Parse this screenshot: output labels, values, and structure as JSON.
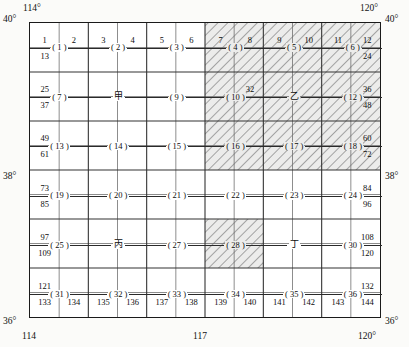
{
  "figure": {
    "type": "map-grid-index",
    "columns": 12,
    "rows": 12
  },
  "axes": {
    "top_left_longitude": "114°",
    "top_right_longitude": "120°",
    "bottom_left_longitude": "114",
    "bottom_mid_longitude": "117",
    "bottom_right_longitude": "120°",
    "top_left_latitude": "40°",
    "top_right_latitude": "40°",
    "mid_left_latitude": "38°",
    "mid_right_latitude": "38°",
    "bottom_left_latitude": "36°",
    "bottom_right_latitude": "36°"
  },
  "chart_data": {
    "type": "table",
    "title": "",
    "xlabel": "Longitude",
    "ylabel": "Latitude",
    "xlim": [
      114,
      120
    ],
    "ylim": [
      36,
      40
    ],
    "grid": true,
    "legend": "none",
    "cell_numbers": [
      [
        1,
        2,
        3,
        4,
        5,
        6,
        7,
        8,
        9,
        10,
        11,
        12
      ],
      [
        13,
        14,
        15,
        16,
        17,
        18,
        19,
        20,
        21,
        22,
        23,
        24
      ],
      [
        25,
        26,
        27,
        28,
        29,
        30,
        31,
        32,
        33,
        34,
        35,
        36
      ],
      [
        37,
        38,
        39,
        40,
        41,
        42,
        43,
        44,
        45,
        46,
        47,
        48
      ],
      [
        49,
        50,
        51,
        52,
        53,
        54,
        55,
        56,
        57,
        58,
        59,
        60
      ],
      [
        61,
        62,
        63,
        64,
        65,
        66,
        67,
        68,
        69,
        70,
        71,
        72
      ],
      [
        73,
        74,
        75,
        76,
        77,
        78,
        79,
        80,
        81,
        82,
        83,
        84
      ],
      [
        85,
        86,
        87,
        88,
        89,
        90,
        91,
        92,
        93,
        94,
        95,
        96
      ],
      [
        97,
        98,
        99,
        100,
        101,
        102,
        103,
        104,
        105,
        106,
        107,
        108
      ],
      [
        109,
        110,
        111,
        112,
        113,
        114,
        115,
        116,
        117,
        118,
        119,
        120
      ],
      [
        121,
        122,
        123,
        124,
        125,
        126,
        127,
        128,
        129,
        130,
        131,
        132
      ],
      [
        133,
        134,
        135,
        136,
        137,
        138,
        139,
        140,
        141,
        142,
        143,
        144
      ]
    ],
    "visible_cell_labels": {
      "row1": [
        "1",
        "2",
        "3",
        "4",
        "5",
        "6",
        "7",
        "8",
        "9",
        "10",
        "11",
        "12"
      ],
      "row12": [
        "133",
        "134",
        "135",
        "136",
        "137",
        "138",
        "139",
        "140",
        "141",
        "142",
        "143",
        "144"
      ],
      "left_edge": [
        "13",
        "25",
        "37",
        "49",
        "61",
        "73",
        "85",
        "97",
        "109",
        "121"
      ],
      "right_edge": [
        "24",
        "36",
        "48",
        "60",
        "72",
        "84",
        "96",
        "108",
        "120",
        "132"
      ],
      "interior": [
        "32"
      ]
    },
    "block_labels": [
      "( 1 )",
      "( 2 )",
      "( 3 )",
      "( 4 )",
      "( 5 )",
      "( 6 )",
      "( 7 )",
      "甲",
      "( 9 )",
      "( 10 )",
      "乙",
      "( 12 )",
      "( 13 )",
      "( 14 )",
      "( 15 )",
      "( 16 )",
      "( 17 )",
      "( 18 )",
      "( 19 )",
      "( 20 )",
      "( 21 )",
      "( 22 )",
      "( 23 )",
      "( 24 )",
      "( 25 )",
      "丙",
      "( 27 )",
      "( 28 )",
      "丁",
      "( 30 )",
      "( 31 )",
      "( 32 )",
      "( 33 )",
      "( 34 )",
      "( 35 )",
      "( 36 )"
    ],
    "hatched_blocks": [
      4,
      5,
      6,
      10,
      11,
      12,
      16,
      17,
      18,
      28
    ],
    "annotations": [
      {
        "text": "甲",
        "block": 8,
        "meaning": "jia - first stem"
      },
      {
        "text": "乙",
        "block": 11,
        "meaning": "yi - second stem"
      },
      {
        "text": "丙",
        "block": 26,
        "meaning": "bing - third stem"
      },
      {
        "text": "丁",
        "block": 29,
        "meaning": "ding - fourth stem"
      }
    ]
  },
  "colors": {
    "frame": "#1a1a1a",
    "grid_major": "#3a3a3a",
    "grid_minor": "#6a6a6a",
    "hatch": "#9a9a9a",
    "hatch_fill": "#ececeb",
    "background": "#fbfbf9"
  }
}
